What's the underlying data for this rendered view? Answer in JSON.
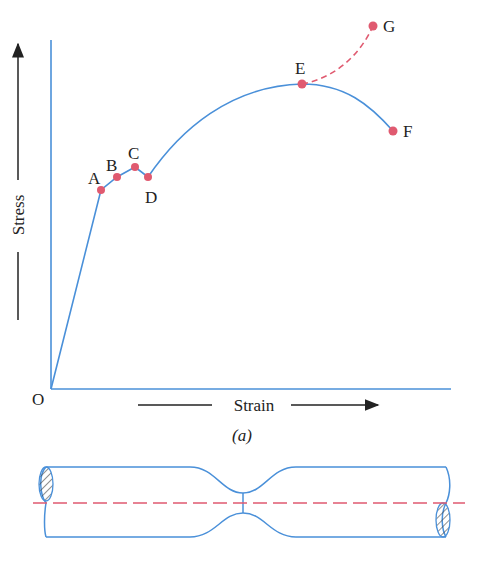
{
  "colors": {
    "curve": "#4a90d9",
    "point": "#e05a70",
    "text": "#222222",
    "background": "#ffffff"
  },
  "diagram": {
    "caption": "(a)",
    "axes": {
      "x_label": "Strain",
      "y_label": "Stress",
      "origin_label": "O"
    },
    "points": [
      {
        "label": "A",
        "x": 101,
        "y": 190
      },
      {
        "label": "B",
        "x": 117,
        "y": 177
      },
      {
        "label": "C",
        "x": 135,
        "y": 167
      },
      {
        "label": "D",
        "x": 148,
        "y": 177
      },
      {
        "label": "E",
        "x": 302,
        "y": 84
      },
      {
        "label": "F",
        "x": 393,
        "y": 131
      },
      {
        "label": "G",
        "x": 373,
        "y": 26
      }
    ],
    "segments": [
      {
        "from": "O",
        "to": "A",
        "style": "solid",
        "description": "proportional limit region"
      },
      {
        "from": "A",
        "to": "D",
        "style": "solid",
        "description": "yield region A-B-C-D"
      },
      {
        "from": "D",
        "to": "E",
        "style": "solid",
        "description": "strain hardening"
      },
      {
        "from": "E",
        "to": "F",
        "style": "solid",
        "description": "necking to fracture"
      },
      {
        "from": "E",
        "to": "G",
        "style": "dashed",
        "description": "true stress curve"
      }
    ],
    "specimen": {
      "description": "Tensile specimen with necked region",
      "centerline": "dashed"
    }
  }
}
